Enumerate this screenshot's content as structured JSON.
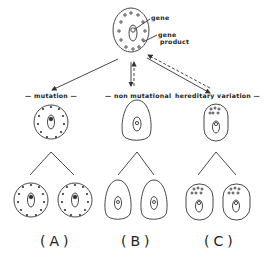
{
  "diagram": {
    "top_cell": {
      "labels": {
        "gene": "gene",
        "gene_product": "gene\nproduct",
        "gene_product_line1": "gene",
        "gene_product_line2": "product"
      }
    },
    "categories": [
      {
        "id": "A",
        "label": "— mutation —",
        "panel": "(A)"
      },
      {
        "id": "B",
        "label": "— non mutational",
        "panel": "(B)"
      },
      {
        "id": "C",
        "label": "hereditary variation —",
        "panel": "(C)"
      }
    ],
    "colors": {
      "stroke": "#333333",
      "background": "#ffffff"
    }
  }
}
